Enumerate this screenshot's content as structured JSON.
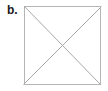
{
  "figure": {
    "panel_label": "b.",
    "caption": "",
    "background_color": "#ffffff"
  },
  "diagram": {
    "type": "geometric-figure",
    "shape_name": "square-with-diagonals",
    "stroke_color": "#b5b5b5",
    "diagonal_color": "#a8a8a8",
    "fill_color": "#ffffff",
    "stroke_width": 1,
    "square": {
      "x": 24,
      "y": 6,
      "width": 77,
      "height": 79
    },
    "vertices": [
      {
        "name": "top-left",
        "x": 24,
        "y": 6
      },
      {
        "name": "top-right",
        "x": 101,
        "y": 6
      },
      {
        "name": "bottom-right",
        "x": 101,
        "y": 85
      },
      {
        "name": "bottom-left",
        "x": 24,
        "y": 85
      }
    ],
    "diagonals": [
      {
        "name": "diagonal-tl-br",
        "x1": 24,
        "y1": 6,
        "x2": 101,
        "y2": 85
      },
      {
        "name": "diagonal-tr-bl",
        "x1": 101,
        "y1": 6,
        "x2": 24,
        "y2": 85
      }
    ],
    "intersection": {
      "name": "center",
      "x": 62.5,
      "y": 45.5
    }
  }
}
